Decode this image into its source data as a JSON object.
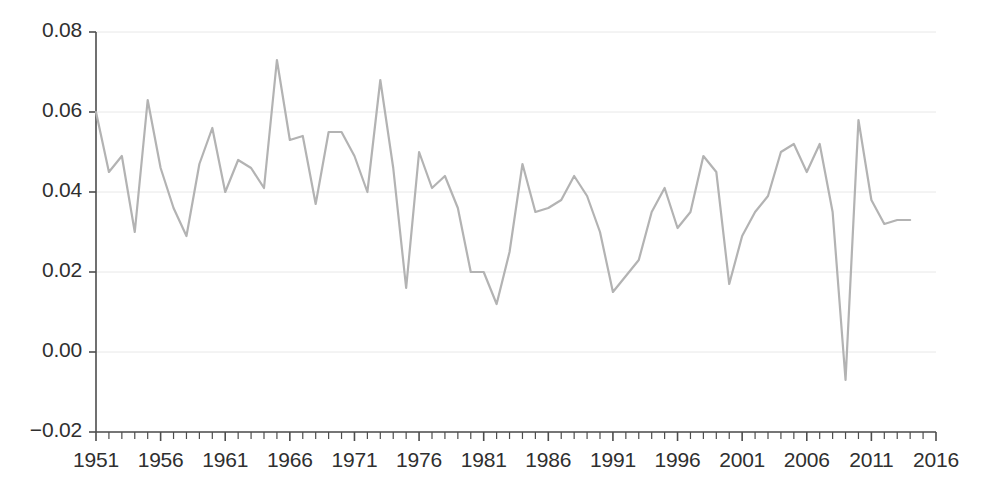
{
  "chart_data": {
    "type": "line",
    "title": "",
    "xlabel": "",
    "ylabel": "",
    "xlim": [
      1951,
      2016
    ],
    "ylim": [
      -0.02,
      0.08
    ],
    "grid": true,
    "grid_axis": "y",
    "legend": "none",
    "line_color": "#b3b3b3",
    "axis_color": "#4d4d4d",
    "grid_color": "#e8e8e8",
    "text_color": "#2f2f2f",
    "line_width": 2.2,
    "y_ticks": [
      -0.02,
      0.0,
      0.02,
      0.04,
      0.06,
      0.08
    ],
    "y_tick_labels": [
      "−0.02",
      "0.00",
      "0.02",
      "0.04",
      "0.06",
      "0.08"
    ],
    "x_ticks": [
      1951,
      1956,
      1961,
      1966,
      1971,
      1976,
      1981,
      1986,
      1991,
      1996,
      2001,
      2006,
      2011,
      2016
    ],
    "x_tick_labels": [
      "1951",
      "1956",
      "1961",
      "1966",
      "1971",
      "1976",
      "1981",
      "1986",
      "1991",
      "1996",
      "2001",
      "2006",
      "2011",
      "2016"
    ],
    "x_minor_tick_step": 1,
    "x": [
      1951,
      1952,
      1953,
      1954,
      1955,
      1956,
      1957,
      1958,
      1959,
      1960,
      1961,
      1962,
      1963,
      1964,
      1965,
      1966,
      1967,
      1968,
      1969,
      1970,
      1971,
      1972,
      1973,
      1974,
      1975,
      1976,
      1977,
      1978,
      1979,
      1980,
      1981,
      1982,
      1983,
      1984,
      1985,
      1986,
      1987,
      1988,
      1989,
      1990,
      1991,
      1992,
      1993,
      1994,
      1995,
      1996,
      1997,
      1998,
      1999,
      2000,
      2001,
      2002,
      2003,
      2004,
      2005,
      2006,
      2007,
      2008,
      2009,
      2010,
      2011,
      2012,
      2013,
      2014
    ],
    "values": [
      0.06,
      0.045,
      0.049,
      0.03,
      0.063,
      0.046,
      0.036,
      0.029,
      0.047,
      0.056,
      0.04,
      0.048,
      0.046,
      0.041,
      0.073,
      0.053,
      0.054,
      0.037,
      0.055,
      0.055,
      0.049,
      0.04,
      0.068,
      0.046,
      0.016,
      0.05,
      0.041,
      0.044,
      0.036,
      0.02,
      0.02,
      0.012,
      0.025,
      0.047,
      0.035,
      0.036,
      0.038,
      0.044,
      0.039,
      0.03,
      0.015,
      0.019,
      0.023,
      0.035,
      0.041,
      0.031,
      0.035,
      0.049,
      0.045,
      0.017,
      0.029,
      0.035,
      0.039,
      0.05,
      0.052,
      0.045,
      0.052,
      0.035,
      -0.007,
      0.058,
      0.038,
      0.032,
      0.033,
      0.033
    ],
    "series": [
      {
        "name": "series-1",
        "color": "#b3b3b3",
        "values": [
          0.06,
          0.045,
          0.049,
          0.03,
          0.063,
          0.046,
          0.036,
          0.029,
          0.047,
          0.056,
          0.04,
          0.048,
          0.046,
          0.041,
          0.073,
          0.053,
          0.054,
          0.037,
          0.055,
          0.055,
          0.049,
          0.04,
          0.068,
          0.046,
          0.016,
          0.05,
          0.041,
          0.044,
          0.036,
          0.02,
          0.02,
          0.012,
          0.025,
          0.047,
          0.035,
          0.036,
          0.038,
          0.044,
          0.039,
          0.03,
          0.015,
          0.019,
          0.023,
          0.035,
          0.041,
          0.031,
          0.035,
          0.049,
          0.045,
          0.017,
          0.029,
          0.035,
          0.039,
          0.05,
          0.052,
          0.045,
          0.052,
          0.035,
          -0.007,
          0.058,
          0.038,
          0.032,
          0.033,
          0.033
        ]
      }
    ],
    "annotations": {
      "max_value": 0.073,
      "max_year": 1965,
      "min_value": -0.007,
      "min_year": 2009
    }
  },
  "plot_geometry": {
    "left": 96,
    "right": 936,
    "top": 32,
    "bottom": 432
  }
}
